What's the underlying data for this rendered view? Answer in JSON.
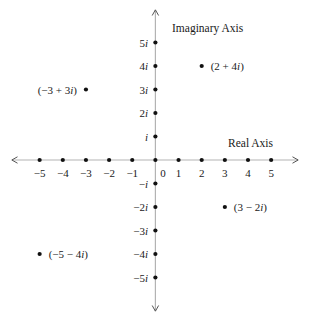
{
  "chart_data": {
    "type": "scatter",
    "xlabel": "Real Axis",
    "ylabel": "Imaginary Axis",
    "xlim": [
      -6,
      6
    ],
    "ylim": [
      -6,
      6
    ],
    "grid": false,
    "x_ticks": [
      {
        "value": -5,
        "label": "−5"
      },
      {
        "value": -4,
        "label": "−4"
      },
      {
        "value": -3,
        "label": "−3"
      },
      {
        "value": -2,
        "label": "−2"
      },
      {
        "value": -1,
        "label": "−1"
      },
      {
        "value": 0,
        "label": "0"
      },
      {
        "value": 1,
        "label": "1"
      },
      {
        "value": 2,
        "label": "2"
      },
      {
        "value": 3,
        "label": "3"
      },
      {
        "value": 4,
        "label": "4"
      },
      {
        "value": 5,
        "label": "5"
      }
    ],
    "y_ticks": [
      {
        "value": 5,
        "label": "5i"
      },
      {
        "value": 4,
        "label": "4i"
      },
      {
        "value": 3,
        "label": "3i"
      },
      {
        "value": 2,
        "label": "2i"
      },
      {
        "value": 1,
        "label": "i"
      },
      {
        "value": -1,
        "label": "−i"
      },
      {
        "value": -2,
        "label": "−2i"
      },
      {
        "value": -3,
        "label": "−3i"
      },
      {
        "value": -4,
        "label": "−4i"
      },
      {
        "value": -5,
        "label": "−5i"
      }
    ],
    "axis_marker_dots_x": [
      -5,
      -4,
      -3,
      -2,
      -1,
      0,
      1,
      2,
      3,
      4,
      5
    ],
    "axis_marker_dots_y": [
      -5,
      -4,
      -3,
      -2,
      -1,
      1,
      2,
      3,
      4,
      5
    ],
    "points": [
      {
        "x": 2,
        "y": 4,
        "label": "(2 + 4i)",
        "label_side": "right"
      },
      {
        "x": -3,
        "y": 3,
        "label": "(−3 + 3i)",
        "label_side": "left"
      },
      {
        "x": 3,
        "y": -2,
        "label": "(3 − 2i)",
        "label_side": "right"
      },
      {
        "x": -5,
        "y": -4,
        "label": "(−5 − 4i)",
        "label_side": "right"
      }
    ],
    "colors": {
      "point": "#111111",
      "axis_line": "#b3b3b3",
      "arrowhead": "#555555",
      "text": "#1a1a1a"
    }
  }
}
